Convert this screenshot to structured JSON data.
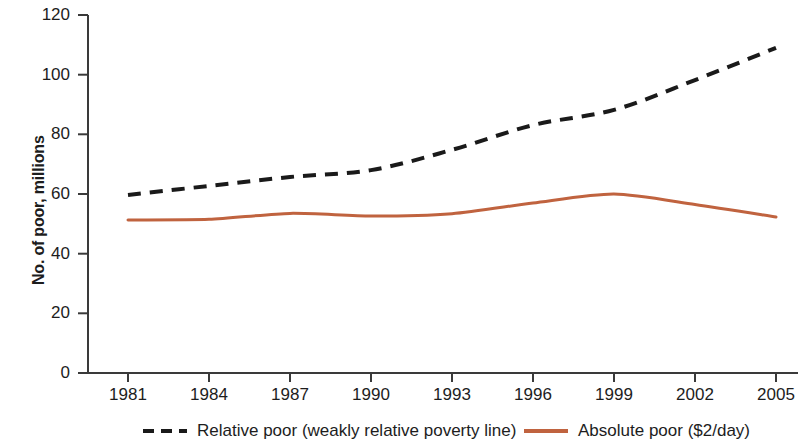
{
  "chart_data": {
    "type": "line",
    "title": "",
    "subtitle": "",
    "xlabel": "",
    "ylabel": "No. of poor, millions",
    "x": [
      1981,
      1984,
      1987,
      1990,
      1993,
      1996,
      1999,
      2002,
      2005
    ],
    "categories": [
      "1981",
      "1984",
      "1987",
      "1990",
      "1993",
      "1996",
      "1999",
      "2002",
      "2005"
    ],
    "xlim": [
      1981,
      2005
    ],
    "ylim": [
      0,
      120
    ],
    "yticks": [
      0,
      20,
      40,
      60,
      80,
      100,
      120
    ],
    "ytick_labels": [
      "0",
      "20",
      "40",
      "60",
      "80",
      "100",
      "120"
    ],
    "grid": false,
    "legend_position": "bottom",
    "series": [
      {
        "name": "Relative poor (weakly relative poverty line)",
        "style": "dashed",
        "color": "#1a1a1a",
        "values": [
          59.7,
          62.7,
          65.7,
          68.0,
          74.8,
          83.1,
          88.2,
          98.2,
          109.0
        ]
      },
      {
        "name": "Absolute poor ($2/day)",
        "style": "solid",
        "color": "#c0633f",
        "values": [
          51.3,
          51.5,
          53.5,
          52.6,
          53.4,
          57.0,
          60.0,
          56.5,
          52.3
        ]
      }
    ]
  },
  "axes": {
    "y_title": "No. of poor, millions",
    "y_tick_labels": [
      "120",
      "100",
      "80",
      "60",
      "40",
      "20",
      "0"
    ],
    "x_tick_labels": [
      "1981",
      "1984",
      "1987",
      "1990",
      "1993",
      "1996",
      "1999",
      "2002",
      "2005"
    ]
  },
  "legend": {
    "entries": [
      {
        "label": "Relative poor (weakly relative poverty line)",
        "swatch": "dashed-black-line-icon"
      },
      {
        "label": "Absolute poor ($2/day)",
        "swatch": "solid-orange-line-icon"
      }
    ]
  },
  "colors": {
    "relative_line": "#1a1a1a",
    "absolute_line": "#c0633f",
    "axis": "#3a3a3a",
    "text": "#1d1d1d",
    "background": "#ffffff"
  }
}
